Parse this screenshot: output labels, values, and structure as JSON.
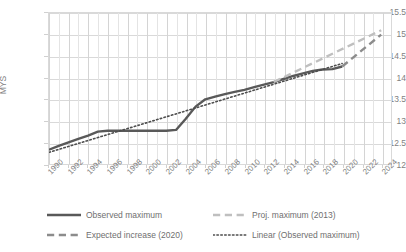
{
  "chart_data": {
    "type": "line",
    "title": "",
    "subtitle": "",
    "xlabel": "",
    "ylabel": "MYS",
    "ylim": [
      12,
      15.5
    ],
    "xlim": [
      1990,
      2025
    ],
    "yticks": [
      "12",
      "12.5",
      "13",
      "13.5",
      "14",
      "14.5",
      "15",
      "15.5"
    ],
    "ytick_values": [
      12,
      12.5,
      13,
      13.5,
      14,
      14.5,
      15,
      15.5
    ],
    "xticks": [
      "1990",
      "1992",
      "1994",
      "1996",
      "1998",
      "2000",
      "2002",
      "2004",
      "2006",
      "2008",
      "2010",
      "2012",
      "2014",
      "2016",
      "2018",
      "2020",
      "2022",
      "2024"
    ],
    "xtick_values": [
      1990,
      1992,
      1994,
      1996,
      1998,
      2000,
      2002,
      2004,
      2006,
      2008,
      2010,
      2012,
      2014,
      2016,
      2018,
      2020,
      2022,
      2024
    ],
    "grid": "both",
    "legend_position": "bottom",
    "series": [
      {
        "name": "Observed maximum",
        "style": "solid",
        "color": "#595959",
        "width": 2.4,
        "x": [
          1990,
          1991,
          1992,
          1993,
          1994,
          1995,
          1996,
          1997,
          1998,
          1999,
          2000,
          2001,
          2002,
          2003,
          2004,
          2005,
          2006,
          2007,
          2008,
          2009,
          2010,
          2011,
          2012,
          2013,
          2014,
          2015,
          2016,
          2017,
          2018,
          2019,
          2020
        ],
        "values": [
          12.33,
          12.42,
          12.5,
          12.58,
          12.66,
          12.75,
          12.77,
          12.77,
          12.77,
          12.77,
          12.77,
          12.77,
          12.77,
          12.79,
          13.05,
          13.33,
          13.5,
          13.56,
          13.62,
          13.67,
          13.72,
          13.78,
          13.84,
          13.9,
          13.97,
          14.04,
          14.1,
          14.16,
          14.19,
          14.2,
          14.26
        ]
      },
      {
        "name": "Proj. maximum (2013)",
        "style": "dashed",
        "color": "#bfbfbf",
        "width": 2.4,
        "x": [
          2013,
          2024
        ],
        "values": [
          13.9,
          15.1
        ]
      },
      {
        "name": "Expected increase (2020)",
        "style": "dashed",
        "color": "#8c8c8c",
        "width": 2.4,
        "x": [
          2020,
          2024
        ],
        "values": [
          14.26,
          15.0
        ]
      },
      {
        "name": "Linear (Observed maximum)",
        "style": "dotted",
        "color": "#4d4d4d",
        "width": 1.6,
        "x": [
          1990,
          2020
        ],
        "values": [
          12.27,
          14.33
        ]
      }
    ]
  },
  "axis": {
    "y_title": "MYS"
  },
  "legend": {
    "items": [
      {
        "label": "Observed maximum",
        "style": "solid",
        "color": "#595959"
      },
      {
        "label": "Expected increase (2020)",
        "style": "dashed",
        "color": "#8c8c8c"
      },
      {
        "label": "Proj. maximum (2013)",
        "style": "dashed",
        "color": "#bfbfbf"
      },
      {
        "label": "Linear (Observed maximum)",
        "style": "dotted",
        "color": "#4d4d4d"
      }
    ]
  },
  "colors": {
    "observed": "#595959",
    "expected": "#8c8c8c",
    "projected": "#bfbfbf",
    "linear": "#4d4d4d",
    "grid": "#d9d9d9",
    "text": "#7f7f7f",
    "background": "#ffffff"
  }
}
